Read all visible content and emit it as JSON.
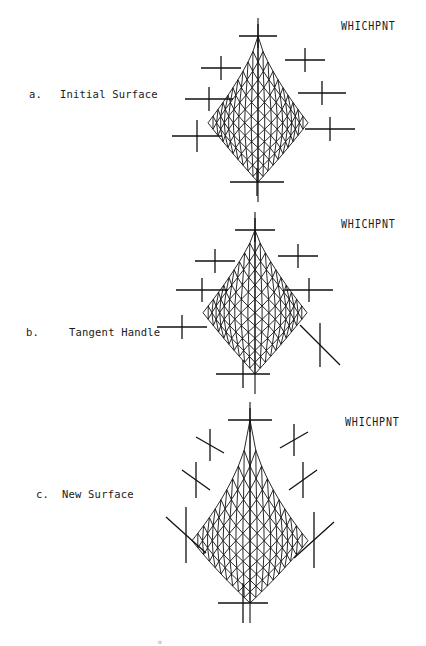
{
  "figures": [
    {
      "letter": "a.",
      "caption": "Initial Surface",
      "tag": "WHICHPNT"
    },
    {
      "letter": "b.",
      "caption": "Tangent Handle",
      "tag": "WHICHPNT"
    },
    {
      "letter": "c.",
      "caption": "New Surface",
      "tag": "WHICHPNT"
    }
  ],
  "page_mark": "o"
}
